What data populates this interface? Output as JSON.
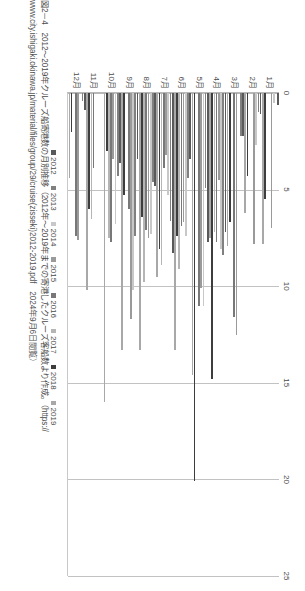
{
  "figure": {
    "caption_line1": "図2－4　2012〜2019年クルーズ船寄港数の月別推移（2012年〜2019年までの寄港したクルーズ客船数より作成。（https://",
    "caption_line2": "www.city.ishigaki.okinawa.jp/material/files/group/29/cruise(zisseki)2012-2019.pdf　2024年9月6日閲覧）"
  },
  "legend": {
    "items": [
      {
        "label": "2012",
        "color": "#595959"
      },
      {
        "label": "2013",
        "color": "#808080"
      },
      {
        "label": "2014",
        "color": "#c8c8c8"
      },
      {
        "label": "2015",
        "color": "#9a9a9a"
      },
      {
        "label": "2016",
        "color": "#787878"
      },
      {
        "label": "2017",
        "color": "#b5b5b5"
      },
      {
        "label": "2018",
        "color": "#3d3d3d"
      },
      {
        "label": "2019",
        "color": "#a8a8a8"
      }
    ]
  },
  "chart_data": {
    "type": "bar",
    "orientation": "horizontal",
    "title": "図2－4　2012〜2019年クルーズ船寄港数の月別推移",
    "xlabel": "",
    "ylabel": "",
    "xlim": [
      0,
      25
    ],
    "xticks": [
      0,
      5,
      10,
      15,
      20,
      25
    ],
    "grid": true,
    "legend_position": "bottom",
    "categories": [
      "1月",
      "2月",
      "3月",
      "4月",
      "5月",
      "6月",
      "7月",
      "8月",
      "9月",
      "10月",
      "11月",
      "12月"
    ],
    "series": [
      {
        "name": "2012",
        "color": "#595959",
        "values": [
          0.6,
          1.1,
          2.2,
          7.2,
          7.7,
          3.4,
          8.3,
          4.8,
          3.4,
          3.6,
          0,
          0.9
        ]
      },
      {
        "name": "2013",
        "color": "#808080",
        "values": [
          0,
          1.0,
          2.2,
          8.4,
          4.9,
          4.4,
          6.6,
          4.6,
          7.4,
          4.3,
          0,
          0.4
        ]
      },
      {
        "name": "2014",
        "color": "#c8c8c8",
        "values": [
          0.5,
          2.7,
          0,
          8.1,
          11.0,
          7.4,
          5.3,
          7.3,
          10.2,
          6.8,
          0,
          0
        ]
      },
      {
        "name": "2015",
        "color": "#9a9a9a",
        "values": [
          7.0,
          7.8,
          12.5,
          4.5,
          10.1,
          6.7,
          3.2,
          7.5,
          11.7,
          3.4,
          0,
          7.6
        ]
      },
      {
        "name": "2016",
        "color": "#787878",
        "values": [
          0,
          0,
          11.6,
          7.7,
          11.0,
          6.9,
          3.9,
          7.1,
          6.0,
          7.7,
          3.9,
          7.4
        ],
        "note": "series drawn per month group"
      },
      {
        "name": "2017",
        "color": "#b5b5b5",
        "values": [
          0,
          0,
          0,
          7.2,
          0,
          9.1,
          8.9,
          9.8,
          0,
          7.5,
          6.5,
          0
        ]
      },
      {
        "name": "2018",
        "color": "#3d3d3d",
        "values": [
          5.5,
          4.3,
          6.7,
          14.8,
          20.1,
          7.4,
          8.1,
          6.4,
          5.3,
          3.0,
          6.0,
          2.0
        ]
      },
      {
        "name": "2019",
        "color": "#a8a8a8",
        "values": [
          7.8,
          6.2,
          7.9,
          7.5,
          14.6,
          13.3,
          9.5,
          13.3,
          13.3,
          16.0,
          10.2,
          4.4
        ]
      }
    ]
  }
}
